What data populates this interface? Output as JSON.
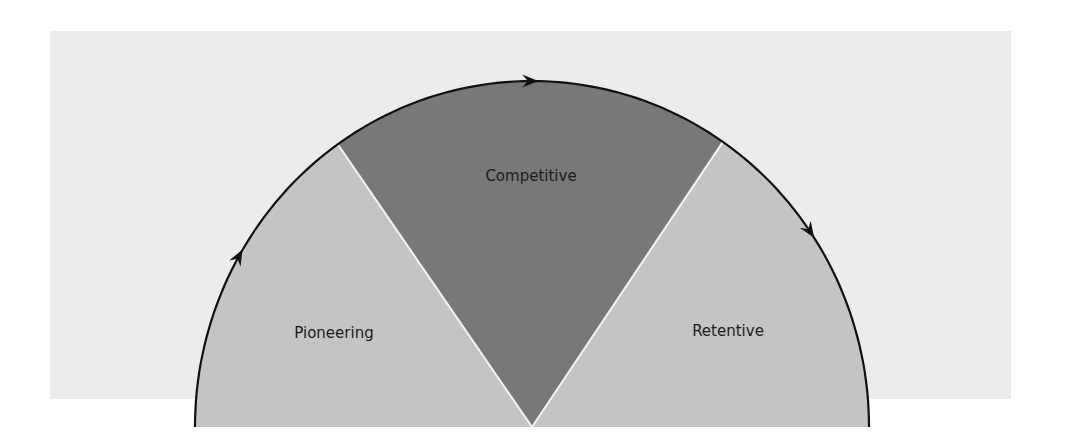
{
  "diagram": {
    "type": "semicircle-cycle",
    "direction": "clockwise",
    "phases": [
      {
        "label": "Pioneering",
        "shade": "light",
        "color": "#c4c4c4"
      },
      {
        "label": "Competitive",
        "shade": "dark",
        "color": "#787878"
      },
      {
        "label": "Retentive",
        "shade": "light",
        "color": "#c4c4c4"
      }
    ],
    "colors": {
      "background_panel": "#ececec",
      "arc_stroke": "#111111",
      "separator": "#f4f4f4",
      "text": "#1c1c1c"
    }
  }
}
